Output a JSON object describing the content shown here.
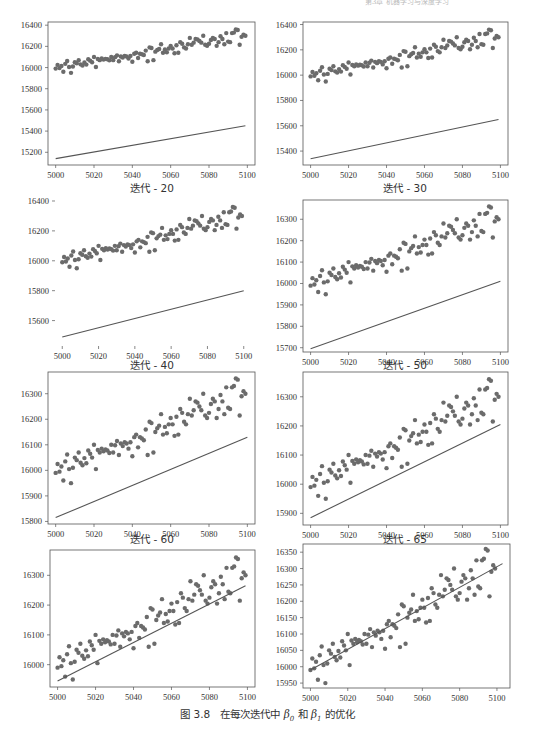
{
  "page_header": "第3章  机器学习与深度学习",
  "figure_caption": {
    "number": "图 3.8",
    "prefix": "在每次迭代中",
    "beta0": "β",
    "beta0_sub": "0",
    "conj": "和",
    "beta1": "β",
    "beta1_sub": "1",
    "suffix": "的优化"
  },
  "colors": {
    "points": "#6b6b6b",
    "line": "#555555",
    "axes": "#555555"
  },
  "chart_data": [
    {
      "type": "scatter",
      "subtitle": "迭代 - 20",
      "xlabel": "",
      "ylabel": "",
      "xlim": [
        4996,
        5104
      ],
      "ylim": [
        15080,
        16430
      ],
      "xticks": [
        5000,
        5020,
        5040,
        5060,
        5080,
        5100
      ],
      "yticks": [
        15200,
        15400,
        15600,
        15800,
        16000,
        16200,
        16400
      ],
      "frame": true,
      "fit_line": {
        "x": [
          5000,
          5099
        ],
        "y": [
          15140,
          15450
        ]
      }
    },
    {
      "type": "scatter",
      "subtitle": "迭代 - 30",
      "xlim": [
        4996,
        5104
      ],
      "ylim": [
        15290,
        16420
      ],
      "xticks": [
        5000,
        5020,
        5040,
        5060,
        5080,
        5100
      ],
      "yticks": [
        15400,
        15600,
        15800,
        16000,
        16200,
        16400
      ],
      "frame": true,
      "fit_line": {
        "x": [
          5000,
          5099
        ],
        "y": [
          15340,
          15650
        ]
      }
    },
    {
      "type": "scatter",
      "subtitle": "迭代 - 40",
      "xlim": [
        4996,
        5104
      ],
      "ylim": [
        15430,
        16420
      ],
      "xticks": [
        5000,
        5020,
        5040,
        5060,
        5080,
        5100
      ],
      "yticks": [
        15600,
        15800,
        16000,
        16200,
        16400
      ],
      "frame": false,
      "fit_line": {
        "x": [
          5000,
          5100
        ],
        "y": [
          15490,
          15800
        ]
      }
    },
    {
      "type": "scatter",
      "subtitle": "迭代 - 50",
      "xlim": [
        4996,
        5104
      ],
      "ylim": [
        15680,
        16390
      ],
      "xticks": [
        5000,
        5020,
        5040,
        5060,
        5080,
        5100
      ],
      "yticks": [
        15700,
        15800,
        15900,
        16000,
        16100,
        16200,
        16300
      ],
      "frame": true,
      "fit_line": {
        "x": [
          5000,
          5100
        ],
        "y": [
          15695,
          16010
        ]
      }
    },
    {
      "type": "scatter",
      "subtitle": "迭代 - 60",
      "xlim": [
        4996,
        5104
      ],
      "ylim": [
        15790,
        16385
      ],
      "xticks": [
        5000,
        5020,
        5040,
        5060,
        5080,
        5100
      ],
      "yticks": [
        15800,
        15900,
        16000,
        16100,
        16200,
        16300
      ],
      "frame": true,
      "fit_line": {
        "x": [
          5000,
          5100
        ],
        "y": [
          15815,
          16130
        ]
      }
    },
    {
      "type": "scatter",
      "subtitle": "迭代 - 65",
      "xlim": [
        4996,
        5104
      ],
      "ylim": [
        15860,
        16385
      ],
      "xticks": [
        5000,
        5020,
        5040,
        5060,
        5080,
        5100
      ],
      "yticks": [
        15900,
        16000,
        16100,
        16200,
        16300
      ],
      "frame": true,
      "fit_line": {
        "x": [
          5000,
          5100
        ],
        "y": [
          15885,
          16205
        ]
      }
    },
    {
      "type": "scatter",
      "subtitle": "",
      "xlim": [
        4996,
        5104
      ],
      "ylim": [
        15925,
        16385
      ],
      "xticks": [
        5000,
        5020,
        5040,
        5060,
        5080,
        5100
      ],
      "yticks": [
        16000,
        16100,
        16200,
        16300
      ],
      "frame": true,
      "fit_line": {
        "x": [
          5000,
          5099
        ],
        "y": [
          15945,
          16265
        ]
      }
    },
    {
      "type": "scatter",
      "subtitle": "",
      "xlim": [
        4996,
        5107
      ],
      "ylim": [
        15935,
        16375
      ],
      "xticks": [
        5000,
        5020,
        5040,
        5060,
        5080,
        5100
      ],
      "yticks": [
        15950,
        16000,
        16050,
        16100,
        16150,
        16200,
        16250,
        16300,
        16350
      ],
      "frame": true,
      "fit_line": {
        "x": [
          5000,
          5103
        ],
        "y": [
          15990,
          16315
        ]
      }
    }
  ],
  "scatter_points": {
    "x": [
      5000,
      5001,
      5002,
      5003,
      5004,
      5005,
      5006,
      5007,
      5008,
      5009,
      5010,
      5011,
      5012,
      5013,
      5014,
      5015,
      5016,
      5017,
      5018,
      5019,
      5020,
      5021,
      5022,
      5023,
      5024,
      5025,
      5026,
      5027,
      5028,
      5029,
      5030,
      5031,
      5032,
      5033,
      5034,
      5035,
      5036,
      5037,
      5038,
      5039,
      5040,
      5041,
      5042,
      5043,
      5044,
      5045,
      5046,
      5047,
      5048,
      5049,
      5050,
      5051,
      5052,
      5053,
      5054,
      5055,
      5056,
      5057,
      5058,
      5059,
      5060,
      5061,
      5062,
      5063,
      5064,
      5065,
      5066,
      5067,
      5068,
      5069,
      5070,
      5071,
      5072,
      5073,
      5074,
      5075,
      5076,
      5077,
      5078,
      5079,
      5080,
      5081,
      5082,
      5083,
      5084,
      5085,
      5086,
      5087,
      5088,
      5089,
      5090,
      5091,
      5092,
      5093,
      5094,
      5095,
      5096,
      5097,
      5098,
      5099
    ],
    "y": [
      15990,
      16025,
      15995,
      16015,
      15960,
      16035,
      16062,
      16005,
      15950,
      16010,
      16050,
      16040,
      16070,
      16030,
      16020,
      16048,
      16028,
      16078,
      16065,
      16050,
      16100,
      16005,
      16080,
      16070,
      16085,
      16075,
      16082,
      16078,
      16068,
      16100,
      16070,
      16098,
      16115,
      16060,
      16105,
      16095,
      16110,
      16105,
      16085,
      16110,
      16055,
      16130,
      16140,
      16090,
      16130,
      16125,
      16118,
      16160,
      16060,
      16190,
      16185,
      16070,
      16150,
      16165,
      16175,
      16220,
      16140,
      16170,
      16145,
      16180,
      16205,
      16180,
      16135,
      16210,
      16140,
      16240,
      16225,
      16190,
      16180,
      16220,
      16280,
      16215,
      16235,
      16270,
      16265,
      16250,
      16235,
      16300,
      16215,
      16205,
      16225,
      16260,
      16280,
      16270,
      16205,
      16240,
      16295,
      16270,
      16220,
      16325,
      16245,
      16240,
      16325,
      16330,
      16360,
      16355,
      16215,
      16290,
      16310,
      16300
    ]
  }
}
